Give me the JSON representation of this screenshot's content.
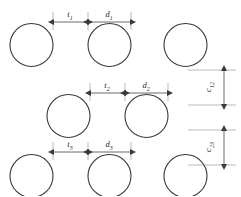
{
  "diagram": {
    "stroke_color": "#3a3a3a",
    "witness_color": "#8a8a8a",
    "background": "#ffffff",
    "rows": [
      {
        "id": "row-1",
        "circle_count": 3,
        "circle_radius": 21.5,
        "center_y": 45,
        "circle_centers_x": [
          31.5,
          109.5,
          185.5
        ],
        "dimension_line_y": 22,
        "gap_label": "t",
        "gap_subscript": "1",
        "diameter_label": "d",
        "diameter_subscript": "1",
        "gap_from_x": 53,
        "gap_to_x": 88,
        "diameter_from_x": 88,
        "diameter_to_x": 131
      },
      {
        "id": "row-2",
        "circle_count": 2,
        "circle_radius": 21.5,
        "center_y": 116,
        "circle_centers_x": [
          68.5,
          146.5
        ],
        "dimension_line_y": 93,
        "gap_label": "t",
        "gap_subscript": "2",
        "diameter_label": "d",
        "diameter_subscript": "2",
        "gap_from_x": 90,
        "gap_to_x": 125,
        "diameter_from_x": 125,
        "diameter_to_x": 168
      },
      {
        "id": "row-3",
        "circle_count": 3,
        "circle_radius": 21.5,
        "center_y": 176,
        "circle_centers_x": [
          31.5,
          109.5,
          185.5
        ],
        "dimension_line_y": 152,
        "gap_label": "t",
        "gap_subscript": "3",
        "diameter_label": "d",
        "diameter_subscript": "3",
        "gap_from_x": 53,
        "gap_to_x": 88,
        "diameter_from_x": 88,
        "diameter_to_x": 131
      }
    ],
    "vertical_dimensions": [
      {
        "id": "spacing-1-2",
        "label": "c",
        "subscript": "12",
        "arrow_x": 224,
        "from_y": 70,
        "to_y": 105,
        "witness_from_x": 188,
        "witness_to_x": 236,
        "label_x": 211,
        "label_y": 87
      },
      {
        "id": "spacing-2-3",
        "label": "c",
        "subscript": "23",
        "arrow_x": 224,
        "from_y": 130,
        "to_y": 165,
        "witness_from_x": 188,
        "witness_to_x": 236,
        "label_x": 211,
        "label_y": 147
      }
    ]
  }
}
